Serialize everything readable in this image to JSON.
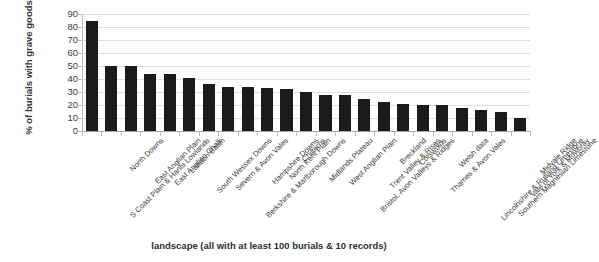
{
  "chart_data": {
    "type": "bar",
    "title": "",
    "xlabel": "landscape (all with at least 100 burials & 10 records)",
    "ylabel": "% of burials with grave goods",
    "ylim": [
      0,
      90
    ],
    "ytick_labels": [
      "90",
      "80",
      "70",
      "60",
      "50",
      "40",
      "30",
      "20",
      "10",
      "0"
    ],
    "ytick_values": [
      90,
      80,
      70,
      60,
      50,
      40,
      30,
      20,
      10,
      0
    ],
    "grid": true,
    "legend": "none",
    "bar_color": "#1b1b1b",
    "categories": [
      "S Coast Plain & Hants Lowlands",
      "North Downs",
      "East Anglian Plain",
      "East Anglian Chalk",
      "London Basin",
      "South Wessex Downs",
      "Severn & Avon Vales",
      "Berkshire & Marlborough Downs",
      "Hampshire Downs",
      "North Kent Plain",
      "Chilterns",
      "Midlands Plateau",
      "West Anglian Plain",
      "Bristol, Avon Valleys & Ridges",
      "Trent Valley & Rises",
      "Breckland",
      "Cotswolds",
      "Thames & Avon Vales",
      "Welsh data",
      "Lincolnshire & Rutland Limestone",
      "Southern Magnesian Limestone",
      "Vale of York & Mowbray",
      "Midvale Ridge"
    ],
    "values": [
      85,
      50,
      50,
      44,
      44,
      41,
      36,
      34,
      34,
      33,
      32,
      30,
      28,
      28,
      25,
      22,
      21,
      20,
      20,
      18,
      16,
      15,
      10
    ]
  }
}
